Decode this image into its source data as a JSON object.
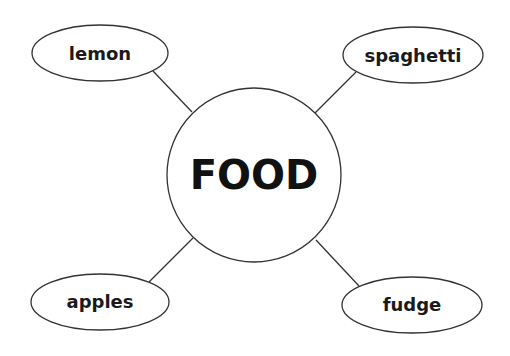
{
  "diagram": {
    "type": "mind-map",
    "colors": {
      "stroke": "#333333",
      "text": "#1a1a1a",
      "background": "#ffffff"
    },
    "center": {
      "label": "FOOD",
      "cx": 254,
      "cy": 175,
      "r": 87
    },
    "nodes": [
      {
        "id": "lemon",
        "label": "lemon",
        "cx": 100,
        "cy": 53,
        "rx": 68,
        "ry": 28,
        "line": [
          153,
          71,
          192,
          112
        ]
      },
      {
        "id": "spaghetti",
        "label": "spaghetti",
        "cx": 413,
        "cy": 55,
        "rx": 70,
        "ry": 28,
        "line": [
          356,
          72,
          315,
          113
        ]
      },
      {
        "id": "apples",
        "label": "apples",
        "cx": 100,
        "cy": 302,
        "rx": 69,
        "ry": 28,
        "line": [
          149,
          282,
          193,
          238
        ]
      },
      {
        "id": "fudge",
        "label": "fudge",
        "cx": 412,
        "cy": 305,
        "rx": 70,
        "ry": 28,
        "line": [
          359,
          286,
          316,
          240
        ]
      }
    ]
  }
}
